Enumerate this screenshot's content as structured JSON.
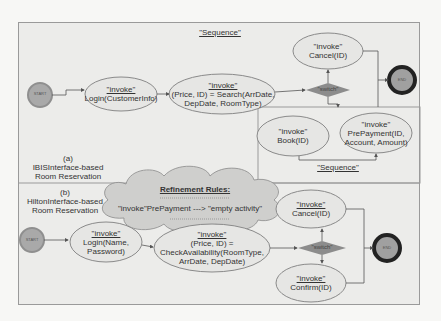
{
  "colors": {
    "background": "#f7f7f5",
    "panel": "#ececea",
    "border": "#9a9a9a",
    "ellipse_fill": "#e6e6e4",
    "ellipse_stroke": "#8a8a8a",
    "start_fill": "#a9a9a9",
    "end_ring": "#222222",
    "end_fill": "#a0a0a0",
    "switch_fill": "#8c8c8c",
    "cloud_fill": "#cfcfcd",
    "edge": "#555555"
  },
  "diagram_a": {
    "label_letter": "(a)",
    "label_line1": "IBISInterface-based",
    "label_line2": "Room Reservation",
    "sequence_title": "\"Sequence\"",
    "start": "START",
    "end": "END",
    "login": {
      "stereotype": "\"invoke\"",
      "call": "Login(CustomerInfo)"
    },
    "search": {
      "stereotype": "\"invoke\"",
      "line1": "(Price, ID) = Search(ArrDate,",
      "line2": "DepDate, RoomType)"
    },
    "switch": "\"switch\"",
    "cancel": {
      "stereotype": "\"invoke\"",
      "call": "Cancel(ID)"
    },
    "book": {
      "stereotype": "\"invoke\"",
      "call": "Book(ID)"
    },
    "prepayment": {
      "stereotype": "\"invoke\"",
      "line1": "PrePayment(ID,",
      "line2": "Account, Amount)"
    },
    "inner_sequence_title": "\"Sequence\""
  },
  "refinement": {
    "title": "Refinement Rules:",
    "rule": "\"invoke\"PrePayment ---> \"empty activity\""
  },
  "diagram_b": {
    "label_letter": "(b)",
    "label_line1": "HiltonInterface-based",
    "label_line2": "Room Reservation",
    "start": "START",
    "end": "END",
    "login": {
      "stereotype": "\"invoke\"",
      "line1": "Login(Name,",
      "line2": "Password)"
    },
    "check": {
      "stereotype": "\"invoke\"",
      "line1": "(Price, ID) =",
      "line2": "CheckAvailability(RoomType,",
      "line3": "ArrDate, DepDate)"
    },
    "switch": "\"switch\"",
    "cancel": {
      "stereotype": "\"invoke\"",
      "call": "Cancel(ID)"
    },
    "confirm": {
      "stereotype": "\"invoke\"",
      "call": "Confirm(ID)"
    }
  }
}
